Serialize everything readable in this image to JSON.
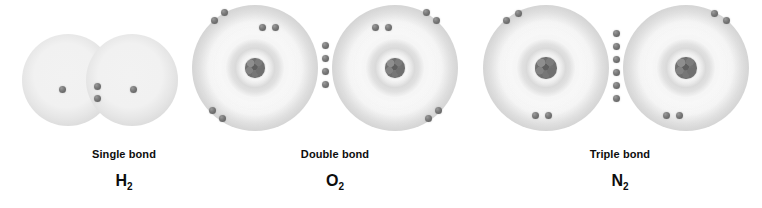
{
  "figure": {
    "background_color": "#ffffff",
    "width": 762,
    "height": 208,
    "title": ""
  },
  "palette": {
    "electron_color": "#6e6e6e",
    "nucleus_color": "#6f6f6f",
    "cloud_color": "#e8e8e8",
    "shell_ring_color": "#c8c8c8",
    "label_color": "#0d0d0d"
  },
  "molecules": [
    {
      "id": "h2",
      "bond_label": "Single bond",
      "formula_symbol": "H",
      "formula_subscript": "2",
      "formula_text": "H2",
      "bond_order": 1,
      "shared_electrons": 2,
      "shell_count": 1,
      "has_visible_nucleus": false,
      "lone_electrons_per_atom": 1,
      "atom_symbol": "H",
      "atom_count": 2
    },
    {
      "id": "o2",
      "bond_label": "Double bond",
      "formula_symbol": "O",
      "formula_subscript": "2",
      "formula_text": "O2",
      "bond_order": 2,
      "shared_electrons": 4,
      "shell_count": 2,
      "has_visible_nucleus": true,
      "lone_electrons_per_atom": 4,
      "atom_symbol": "O",
      "atom_count": 2
    },
    {
      "id": "n2",
      "bond_label": "Triple bond",
      "formula_symbol": "N",
      "formula_subscript": "2",
      "formula_text": "N2",
      "bond_order": 3,
      "shared_electrons": 6,
      "shell_count": 2,
      "has_visible_nucleus": true,
      "lone_electrons_per_atom": 2,
      "atom_symbol": "N",
      "atom_count": 2
    }
  ],
  "geometry": {
    "h2": {
      "group_left": 0,
      "group_width": 248,
      "atoms": [
        {
          "cx": 68,
          "cy": 80,
          "r": 46
        },
        {
          "cx": 132,
          "cy": 80,
          "r": 46
        }
      ],
      "lone_electrons": [
        {
          "x": 62,
          "y": 89
        },
        {
          "x": 133,
          "y": 89
        }
      ],
      "shared_electrons": [
        {
          "x": 97,
          "y": 86
        },
        {
          "x": 97,
          "y": 98
        }
      ]
    },
    "o2": {
      "group_left": 190,
      "group_width": 290,
      "atoms": [
        {
          "cx": 65,
          "cy": 68,
          "r": 63
        },
        {
          "cx": 205,
          "cy": 68,
          "r": 63
        }
      ],
      "nuclei": [
        {
          "x": 65,
          "y": 68,
          "d": 20
        },
        {
          "x": 205,
          "y": 68,
          "d": 20
        }
      ],
      "lone_electrons": [
        {
          "x": 24,
          "y": 20
        },
        {
          "x": 34,
          "y": 12
        },
        {
          "x": 72,
          "y": 27
        },
        {
          "x": 85,
          "y": 27
        },
        {
          "x": 22,
          "y": 110
        },
        {
          "x": 32,
          "y": 118
        },
        {
          "x": 185,
          "y": 27
        },
        {
          "x": 198,
          "y": 27
        },
        {
          "x": 236,
          "y": 12
        },
        {
          "x": 246,
          "y": 20
        },
        {
          "x": 238,
          "y": 118
        },
        {
          "x": 248,
          "y": 110
        }
      ],
      "shared_electrons": [
        {
          "x": 135,
          "y": 45
        },
        {
          "x": 135,
          "y": 58
        },
        {
          "x": 135,
          "y": 71
        },
        {
          "x": 135,
          "y": 84
        }
      ]
    },
    "n2": {
      "group_left": 478,
      "group_width": 284,
      "atoms": [
        {
          "cx": 68,
          "cy": 68,
          "r": 63
        },
        {
          "cx": 208,
          "cy": 68,
          "r": 63
        }
      ],
      "nuclei": [
        {
          "x": 68,
          "y": 68,
          "d": 22
        },
        {
          "x": 208,
          "y": 68,
          "d": 22
        }
      ],
      "lone_electrons": [
        {
          "x": 28,
          "y": 20
        },
        {
          "x": 40,
          "y": 13
        },
        {
          "x": 57,
          "y": 115
        },
        {
          "x": 70,
          "y": 115
        },
        {
          "x": 188,
          "y": 115
        },
        {
          "x": 201,
          "y": 115
        },
        {
          "x": 236,
          "y": 13
        },
        {
          "x": 248,
          "y": 20
        }
      ],
      "shared_electrons": [
        {
          "x": 138,
          "y": 33
        },
        {
          "x": 138,
          "y": 46
        },
        {
          "x": 138,
          "y": 59
        },
        {
          "x": 138,
          "y": 72
        },
        {
          "x": 138,
          "y": 85
        },
        {
          "x": 138,
          "y": 98
        }
      ]
    }
  }
}
